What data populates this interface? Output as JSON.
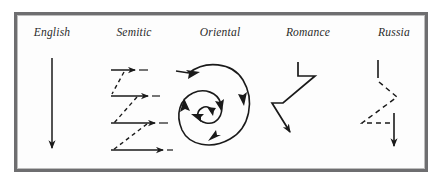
{
  "figure": {
    "background_color": "#ffffff",
    "frame_color": "#6e6e70",
    "ink_color": "#1a1a1a",
    "columns": [
      {
        "id": "english",
        "label": "English",
        "label_x": 52,
        "label_y": 32,
        "pattern": "straight-vertical-arrow",
        "line_style": "solid",
        "description": "A single straight vertical line running downward ending in a solid arrowhead."
      },
      {
        "id": "semitic",
        "label": "Semitic",
        "label_x": 134,
        "label_y": 32,
        "pattern": "parallel-horizontal-arrows-with-dashed-returns",
        "line_style": "solid horizontal arrows, dashed diagonal connectors",
        "arrow_count": 4,
        "description": "Four solid horizontal arrows pointing right, joined by dashed diagonal lines that run back down to the left."
      },
      {
        "id": "oriental",
        "label": "Oriental",
        "label_x": 220,
        "label_y": 32,
        "pattern": "inward-spiral-with-arrowheads",
        "line_style": "solid",
        "turns": 2,
        "description": "A solid spiral curving inward toward a centre point, with arrowheads placed along the arcs."
      },
      {
        "id": "romance",
        "label": "Romance",
        "label_x": 308,
        "label_y": 32,
        "pattern": "zigzag-digression-arrow",
        "line_style": "solid",
        "description": "A solid zigzag path with sideways digressions that finally descends to a downward arrowhead."
      },
      {
        "id": "russia",
        "label": "Russia",
        "label_x": 394,
        "label_y": 32,
        "pattern": "dashed-zigzag-arrow",
        "line_style": "solid start and finish, dashed middle",
        "description": "A short solid stroke downward, then long dashed digressions out to the left and back, ending in a solid downward arrowhead."
      }
    ]
  }
}
